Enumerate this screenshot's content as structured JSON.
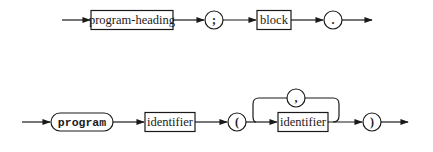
{
  "diagram": {
    "type": "syntax-diagram",
    "rows": [
      {
        "name": "program",
        "elements": [
          {
            "kind": "nonterminal",
            "label": "program-heading"
          },
          {
            "kind": "terminal",
            "label": ";"
          },
          {
            "kind": "nonterminal",
            "label": "block"
          },
          {
            "kind": "terminal",
            "label": "."
          }
        ]
      },
      {
        "name": "program-heading",
        "elements": [
          {
            "kind": "keyword",
            "label": "program"
          },
          {
            "kind": "nonterminal",
            "label": "identifier"
          },
          {
            "kind": "terminal",
            "label": "("
          },
          {
            "kind": "nonterminal",
            "label": "identifier",
            "repeat_separator": ","
          },
          {
            "kind": "terminal",
            "label": ")"
          }
        ]
      }
    ]
  },
  "labels": {
    "program_heading": "program-heading",
    "semicolon": ";",
    "block": "block",
    "period": ".",
    "program_kw": "program",
    "identifier_1": "identifier",
    "lparen": "(",
    "comma": ",",
    "identifier_2": "identifier",
    "rparen": ")"
  },
  "colors": {
    "stroke": "#1a1a1a",
    "background": "#ffffff"
  }
}
